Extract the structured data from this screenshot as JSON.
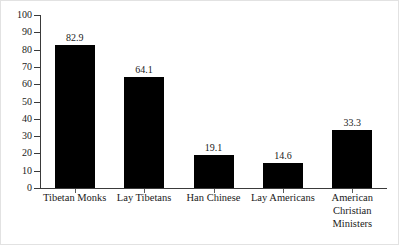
{
  "chart_data": {
    "type": "bar",
    "title": "",
    "subtitle": "",
    "xlabel": "",
    "ylabel": "",
    "categories": [
      "Tibetan Monks",
      "Lay Tibetans",
      "Han Chinese",
      "Lay Americans",
      "American\nChristian\nMinisters"
    ],
    "values": [
      82.9,
      64.1,
      19.1,
      14.6,
      33.3
    ],
    "value_labels": [
      "82.9",
      "64.1",
      "19.1",
      "14.6",
      "33.3"
    ],
    "ylim": [
      0,
      100
    ],
    "ytick_values": [
      0,
      10,
      20,
      30,
      40,
      50,
      60,
      70,
      80,
      90,
      100
    ],
    "ytick_labels": [
      "0",
      "10",
      "20",
      "30",
      "40",
      "50",
      "60",
      "70",
      "80",
      "90",
      "100"
    ],
    "grid": false,
    "legend": null,
    "legend_position": "none",
    "bar_color": "#000000",
    "axis_color": "#3a3a3a",
    "background_color": "#ffffff",
    "annotations": []
  },
  "figure": {
    "frame_color": "#e2e2e2"
  }
}
